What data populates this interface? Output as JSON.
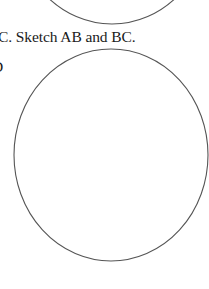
{
  "page": {
    "question_text": "C. Sketch AB and BC.",
    "label_fragment": "D"
  },
  "figures": {
    "stroke_color": "#555555",
    "circles": [
      {
        "name": "top-circle",
        "cx": 112,
        "cy": -82,
        "rx": 97,
        "ry": 106,
        "partial": true
      },
      {
        "name": "main-circle",
        "cx": 111,
        "cy": 155,
        "rx": 97,
        "ry": 106,
        "partial": false
      }
    ]
  }
}
